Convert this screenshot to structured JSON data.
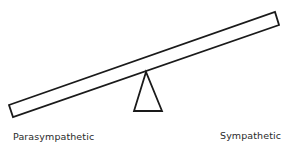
{
  "diagram": {
    "type": "seesaw-balance",
    "left_label": "Parasympathetic",
    "right_label": "Sympathetic",
    "tilt": "right side up",
    "stroke_color": "#1a1a1a",
    "background": "#ffffff"
  }
}
